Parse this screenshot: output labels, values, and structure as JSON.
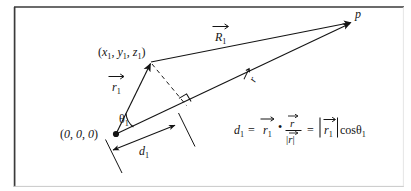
{
  "figure": {
    "type": "vector-projection-diagram",
    "background_color": "#ffffff",
    "ink_color": "#141414",
    "border_color": "#3a3a3a",
    "labels": {
      "origin": "(0, 0, 0)",
      "source_point": "(x₁, y₁, z₁)",
      "field_point": "p",
      "vector_r1": "r₁",
      "vector_R1": "R₁",
      "vector_r": "r",
      "angle": "θ₁",
      "distance": "d₁"
    },
    "equation": {
      "lhs": "d₁",
      "equals_1": "=",
      "term_vector": "r₁",
      "dot_operator": "•",
      "fraction_numerator": "r",
      "fraction_denominator": "|r|",
      "equals_2": "=",
      "magnitude_term": "|r₁|",
      "cos_term": "cos",
      "cos_angle": "θ₁",
      "plain_text": "d₁ = r⃗₁ • r⃗/|r⃗| = |r⃗₁| cosθ₁"
    },
    "glyphs": {
      "variable_d": "d",
      "variable_r": "r",
      "variable_R": "R",
      "variable_x": "x",
      "variable_y": "y",
      "variable_z": "z",
      "variable_p": "p",
      "subscript_one": "1",
      "theta": "θ",
      "equals": "=",
      "bullet": "•",
      "bar": "|",
      "comma": ",",
      "paren_open": "(",
      "paren_close": ")",
      "zero": "0",
      "cos": "cos"
    },
    "geometry": {
      "origin_xy": [
        116,
        134
      ],
      "source_point_xy": [
        150,
        62
      ],
      "field_point_xy": [
        353,
        22
      ],
      "foot_of_perpendicular_xy": [
        186,
        105
      ],
      "dimension_start_xy": [
        113,
        149
      ],
      "dimension_end_xy": [
        176,
        126
      ]
    }
  }
}
